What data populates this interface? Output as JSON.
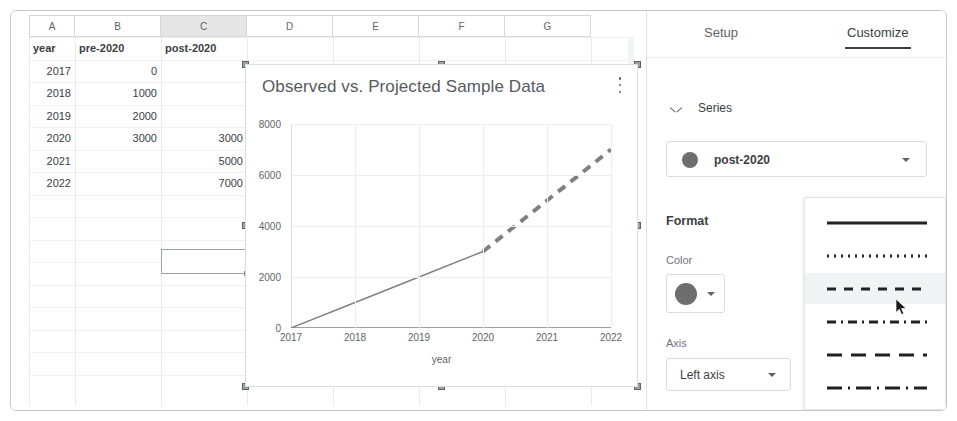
{
  "spreadsheet": {
    "column_headers": [
      "A",
      "B",
      "C",
      "D",
      "E",
      "F",
      "G"
    ],
    "selected_column": "C",
    "headers_row": [
      "year",
      "pre-2020",
      "post-2020"
    ],
    "rows": [
      {
        "year": "2017",
        "pre": "0",
        "post": ""
      },
      {
        "year": "2018",
        "pre": "1000",
        "post": ""
      },
      {
        "year": "2019",
        "pre": "2000",
        "post": ""
      },
      {
        "year": "2020",
        "pre": "3000",
        "post": "3000"
      },
      {
        "year": "2021",
        "pre": "",
        "post": "5000"
      },
      {
        "year": "2022",
        "pre": "",
        "post": "7000"
      }
    ]
  },
  "chart_data": {
    "type": "line",
    "title": "Observed vs. Projected Sample Data",
    "xlabel": "year",
    "ylabel": "",
    "x": [
      2017,
      2018,
      2019,
      2020,
      2021,
      2022
    ],
    "xticks": [
      "2017",
      "2018",
      "2019",
      "2020",
      "2021",
      "2022"
    ],
    "yticks": [
      "0",
      "2000",
      "4000",
      "6000",
      "8000"
    ],
    "ylim": [
      0,
      8000
    ],
    "xlim": [
      2017,
      2022
    ],
    "grid": true,
    "legend": "none",
    "series": [
      {
        "name": "pre-2020",
        "style": "solid",
        "color": "#808080",
        "x": [
          2017,
          2018,
          2019,
          2020
        ],
        "values": [
          0,
          1000,
          2000,
          3000
        ]
      },
      {
        "name": "post-2020",
        "style": "dashed",
        "color": "#808080",
        "x": [
          2020,
          2021,
          2022
        ],
        "values": [
          3000,
          5000,
          7000
        ]
      }
    ],
    "menu_icon": "kebab-menu-icon"
  },
  "panel": {
    "tabs": [
      {
        "label": "Setup",
        "active": false
      },
      {
        "label": "Customize",
        "active": true
      }
    ],
    "section": {
      "label": "Series",
      "expanded": true
    },
    "series_select": {
      "value": "post-2020",
      "color": "#6e6e6e"
    },
    "format_heading": "Format",
    "color": {
      "label": "Color",
      "value": "#6e6e6e"
    },
    "axis": {
      "label": "Axis",
      "value": "Left axis"
    },
    "line_style_menu": {
      "options": [
        {
          "name": "solid",
          "hovered": false
        },
        {
          "name": "dotted",
          "hovered": false
        },
        {
          "name": "dashed",
          "hovered": true
        },
        {
          "name": "dash-dot",
          "hovered": false
        },
        {
          "name": "long-dash",
          "hovered": false
        },
        {
          "name": "long-dash-dot",
          "hovered": false
        }
      ]
    }
  }
}
